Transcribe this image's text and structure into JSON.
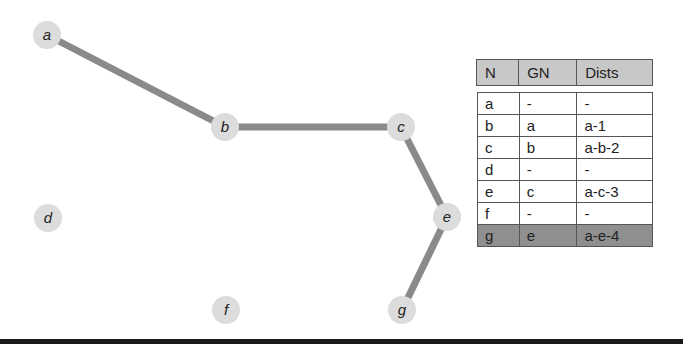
{
  "graph": {
    "edge_color": "#8a8a8a",
    "node_color": "#dcdcdc",
    "nodes": [
      {
        "id": "a",
        "label": "a",
        "x": 47,
        "y": 35
      },
      {
        "id": "b",
        "label": "b",
        "x": 225,
        "y": 127
      },
      {
        "id": "c",
        "label": "c",
        "x": 401,
        "y": 127
      },
      {
        "id": "d",
        "label": "d",
        "x": 48,
        "y": 218
      },
      {
        "id": "e",
        "label": "e",
        "x": 447,
        "y": 217
      },
      {
        "id": "f",
        "label": "f",
        "x": 226,
        "y": 310
      },
      {
        "id": "g",
        "label": "g",
        "x": 402,
        "y": 310
      }
    ],
    "edges": [
      [
        "a",
        "b"
      ],
      [
        "b",
        "c"
      ],
      [
        "c",
        "e"
      ],
      [
        "e",
        "g"
      ]
    ]
  },
  "table": {
    "headers": [
      "N",
      "GN",
      "Dists"
    ],
    "rows": [
      {
        "n": "a",
        "gn": "-",
        "dists": "-"
      },
      {
        "n": "b",
        "gn": "a",
        "dists": "a-1"
      },
      {
        "n": "c",
        "gn": "b",
        "dists": "a-b-2"
      },
      {
        "n": "d",
        "gn": "-",
        "dists": "-"
      },
      {
        "n": "e",
        "gn": "c",
        "dists": "a-c-3"
      },
      {
        "n": "f",
        "gn": "-",
        "dists": "-"
      },
      {
        "n": "g",
        "gn": "e",
        "dists": "a-e-4",
        "highlighted": true
      }
    ]
  }
}
